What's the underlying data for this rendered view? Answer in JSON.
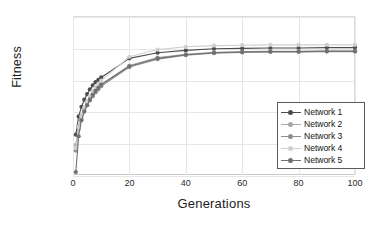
{
  "chart_data": {
    "type": "line",
    "title": "",
    "xlabel": "Generations",
    "ylabel": "Fitness",
    "xlim": [
      0,
      100
    ],
    "ylim": [
      980000,
      1000000
    ],
    "xticks": [
      0,
      20,
      40,
      60,
      80,
      100
    ],
    "yticks": [
      980000,
      984000,
      988000,
      992000,
      996000,
      1000000
    ],
    "ytick_labels": [
      "980000",
      "984000",
      "988000",
      "992000",
      "996000",
      "1000000"
    ],
    "xtick_labels": [
      "0",
      "20",
      "40",
      "60",
      "80",
      "100"
    ],
    "grid": true,
    "legend_position": "inside-bottom-right",
    "x": [
      1,
      2,
      3,
      4,
      5,
      6,
      7,
      8,
      9,
      10,
      20,
      30,
      40,
      50,
      60,
      70,
      80,
      90,
      100
    ],
    "series": [
      {
        "name": "Network 1",
        "color": "#4d4d4d",
        "values": [
          985200,
          987500,
          988700,
          989600,
          990300,
          990900,
          991400,
          991800,
          992100,
          992400,
          994800,
          995500,
          995800,
          996000,
          996050,
          996100,
          996100,
          996150,
          996150
        ]
      },
      {
        "name": "Network 2",
        "color": "#a8a8a8",
        "values": [
          983900,
          986300,
          987600,
          988500,
          989200,
          989800,
          990400,
          990800,
          991200,
          991500,
          993900,
          994900,
          995300,
          995550,
          995650,
          995700,
          995700,
          995750,
          995750
        ]
      },
      {
        "name": "Network 3",
        "color": "#8f8f8f",
        "values": [
          983200,
          985900,
          987200,
          988200,
          988900,
          989500,
          990000,
          990500,
          990900,
          991300,
          993700,
          994700,
          995200,
          995450,
          995550,
          995600,
          995600,
          995650,
          995650
        ]
      },
      {
        "name": "Network 4",
        "color": "#cfcfcf",
        "values": [
          983500,
          986100,
          987500,
          988600,
          989400,
          990100,
          990700,
          991200,
          991600,
          992000,
          995000,
          995900,
          996250,
          996400,
          996450,
          996500,
          996500,
          996500,
          996500
        ]
      },
      {
        "name": "Network 5",
        "color": "#707070",
        "values": [
          980500,
          985000,
          987000,
          988100,
          988900,
          989600,
          990200,
          990700,
          991100,
          991500,
          993800,
          994800,
          995250,
          995500,
          995600,
          995650,
          995650,
          995700,
          995700
        ]
      }
    ]
  }
}
